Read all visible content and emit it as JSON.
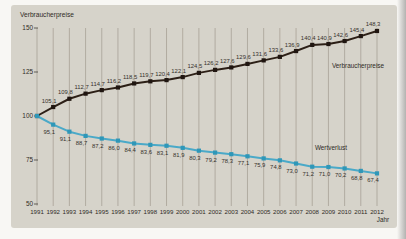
{
  "page": {
    "background": "#f8f7f4",
    "panel_color": "#d6d3ca",
    "gridline_color": "#a29b8f",
    "text_color": "#2f2b26",
    "edge_shadow_color": "#b3b2b0"
  },
  "labels": {
    "axis_title": "Verbraucherpreise",
    "x_axis_title": "Jahr",
    "series1_inplot": "Verbraucherpreise",
    "series2_inplot": "Wertverlust"
  },
  "chart_data": {
    "type": "line",
    "title": "Verbraucherpreise",
    "xlabel": "Jahr",
    "ylabel": "Verbraucherpreise",
    "ylim": [
      50,
      150
    ],
    "yticks": [
      150,
      125,
      100,
      75,
      50
    ],
    "grid": "vertical",
    "legend_position": "inline-labels",
    "x": [
      1991,
      1992,
      1993,
      1994,
      1995,
      1996,
      1997,
      1998,
      1999,
      2000,
      2001,
      2002,
      2003,
      2004,
      2005,
      2006,
      2007,
      2008,
      2009,
      2010,
      2011,
      2012
    ],
    "series": [
      {
        "name": "Verbraucherpreise",
        "color": "#2c1f16",
        "marker_color": "#201611",
        "values": [
          100,
          105.1,
          109.8,
          112.7,
          114.7,
          116.2,
          118.5,
          119.7,
          120.4,
          122.1,
          124.5,
          126.2,
          127.6,
          129.6,
          131.6,
          133.6,
          136.9,
          140.4,
          140.9,
          142.6,
          145.4,
          148.3
        ],
        "value_labels": [
          "",
          "105,1",
          "109,8",
          "112,7",
          "114,7",
          "116,2",
          "118,5",
          "119,7",
          "120,4",
          "122,1",
          "124,5",
          "126,2",
          "127,6",
          "129,6",
          "131,6",
          "133,6",
          "136,9",
          "140,4",
          "140,9",
          "142,6",
          "145,4",
          "148,3"
        ]
      },
      {
        "name": "Wertverlust",
        "color": "#4aa9c8",
        "marker_color": "#2f97b8",
        "values": [
          100,
          95.1,
          91.1,
          88.7,
          87.2,
          86.0,
          84.4,
          83.6,
          83.1,
          81.9,
          80.3,
          79.2,
          78.3,
          77.1,
          75.9,
          74.8,
          73.0,
          71.2,
          71.0,
          70.2,
          68.8,
          67.4
        ],
        "value_labels": [
          "",
          "95,1",
          "91,1",
          "88,7",
          "87,2",
          "86,0",
          "84,4",
          "83,6",
          "83,1",
          "81,9",
          "80,3",
          "79,2",
          "78,3",
          "77,1",
          "75,9",
          "74,8",
          "73,0",
          "71,2",
          "71,0",
          "70,2",
          "68,8",
          "67,4"
        ]
      }
    ]
  }
}
